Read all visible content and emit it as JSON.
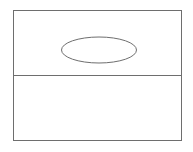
{
  "diagram": {
    "canvas": {
      "width": 193,
      "height": 152,
      "background": "#ffffff"
    },
    "stroke_color": "#6e6e6e",
    "stroke_width": 1,
    "outer_rect": {
      "x": 13.5,
      "y": 10.5,
      "width": 168,
      "height": 130
    },
    "divider": {
      "x1": 13.5,
      "y1": 75.5,
      "x2": 181.5,
      "y2": 75.5
    },
    "ellipse": {
      "cx": 99,
      "cy": 50,
      "rx": 37.5,
      "ry": 13
    }
  }
}
